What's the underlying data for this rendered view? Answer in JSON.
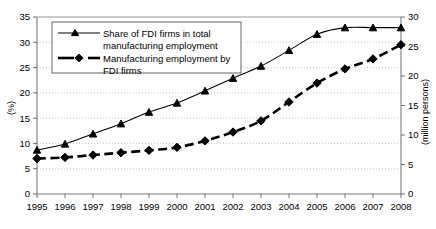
{
  "chart_data": {
    "type": "line",
    "title": "",
    "xlabel": "",
    "ylabel": "(%)",
    "y2label": "(million persons)",
    "categories": [
      "1995",
      "1996",
      "1997",
      "1998",
      "1999",
      "2000",
      "2001",
      "2002",
      "2003",
      "2004",
      "2005",
      "2006",
      "2007",
      "2008"
    ],
    "x": [
      1995,
      1996,
      1997,
      1998,
      1999,
      2000,
      2001,
      2002,
      2003,
      2004,
      2005,
      2006,
      2007,
      2008
    ],
    "ylim": [
      0,
      35
    ],
    "y2lim": [
      0,
      30
    ],
    "yticks": [
      0,
      5,
      10,
      15,
      20,
      25,
      30,
      35
    ],
    "y2ticks": [
      0,
      5,
      10,
      15,
      20,
      25,
      30
    ],
    "grid": true,
    "legend_position": "upper-left-inside",
    "series": [
      {
        "name": "Share of FDI firms in total manufacturing employment",
        "axis": "left",
        "unit": "%",
        "marker": "triangle",
        "line_style": "solid",
        "color": "#000000",
        "values": [
          8.7,
          9.9,
          11.9,
          13.9,
          16.2,
          18.0,
          20.4,
          22.9,
          25.3,
          28.4,
          31.6,
          32.9,
          32.9,
          32.9
        ]
      },
      {
        "name": "Manufacturing employment by FDI firms",
        "axis": "right",
        "unit": "million persons",
        "marker": "diamond",
        "line_style": "dashed",
        "color": "#000000",
        "values": [
          6.0,
          6.2,
          6.6,
          7.0,
          7.4,
          7.9,
          9.0,
          10.5,
          12.4,
          15.6,
          18.8,
          21.2,
          22.9,
          25.3
        ]
      }
    ]
  },
  "legend": {
    "entries": [
      {
        "label_line1": "Share of FDI firms in total",
        "label_line2": "manufacturing employment"
      },
      {
        "label_line1": "Manufacturing employment by",
        "label_line2": "FDI firms"
      }
    ]
  },
  "axes": {
    "left_title": "(%)",
    "right_title": "(million persons)"
  }
}
